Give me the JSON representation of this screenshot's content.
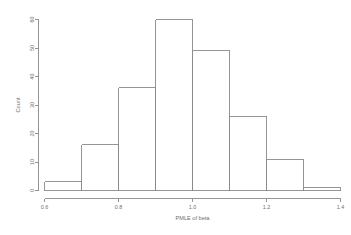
{
  "chart_data": {
    "type": "bar",
    "subtype": "histogram",
    "title": "",
    "xlabel": "PMLE of beta",
    "ylabel": "Count",
    "xlim": [
      0.6,
      1.4
    ],
    "ylim": [
      0,
      60
    ],
    "grid": false,
    "legend": null,
    "bin_width": 0.1,
    "bin_edges": [
      0.6,
      0.7,
      0.8,
      0.9,
      1.0,
      1.1,
      1.2,
      1.3,
      1.4
    ],
    "categories": [
      "0.6-0.7",
      "0.7-0.8",
      "0.8-0.9",
      "0.9-1.0",
      "1.0-1.1",
      "1.1-1.2",
      "1.2-1.3",
      "1.3-1.4"
    ],
    "values": [
      3,
      16,
      36,
      60,
      49,
      26,
      11,
      1
    ],
    "x_ticks": [
      0.6,
      0.8,
      1.0,
      1.2,
      1.4
    ],
    "x_tick_labels": [
      "0.6",
      "0.8",
      "1.0",
      "1.2",
      "1.4"
    ],
    "y_ticks": [
      0,
      10,
      20,
      30,
      40,
      50,
      60
    ],
    "y_tick_labels": [
      "0",
      "10",
      "20",
      "30",
      "40",
      "50",
      "60"
    ],
    "bar_fill": "none",
    "bar_stroke": "#8a8a8a",
    "axis_color": "#8a8a8a",
    "text_color": "#6f6f6f",
    "background": "#ffffff"
  }
}
